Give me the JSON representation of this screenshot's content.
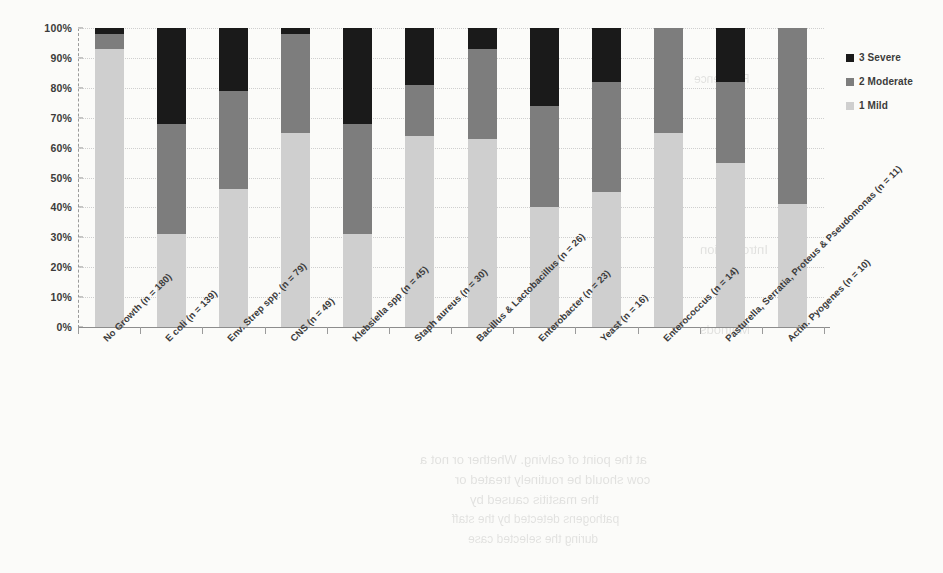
{
  "chart_data": {
    "type": "bar",
    "subtype": "100% stacked column",
    "title": "",
    "xlabel": "",
    "ylabel": "",
    "ylim": [
      0,
      100
    ],
    "ytick_labels": [
      "100%",
      "90%",
      "80%",
      "70%",
      "60%",
      "50%",
      "40%",
      "30%",
      "20%",
      "10%",
      "0%"
    ],
    "ytick_values": [
      100,
      90,
      80,
      70,
      60,
      50,
      40,
      30,
      20,
      10,
      0
    ],
    "grid": "horizontal dotted",
    "legend_position": "right",
    "categories": [
      "No Growth (n = 180)",
      "E coli (n = 139)",
      "Env. Strep spp. (n = 79)",
      "CNS (n = 49)",
      "Klebsiella spp (n = 45)",
      "Staph aureus (n = 30)",
      "Bacillus & Lactobacillus (n = 26)",
      "Enterobacter (n = 23)",
      "Yeast (n = 16)",
      "Enterococcus (n = 14)",
      "Pasturella, Serratia, Proteus & Pseudomonas (n = 11)",
      "Actin. Pyogenes (n = 10)"
    ],
    "series": [
      {
        "name": "1 Mild",
        "color": "#cfcfcf",
        "values": [
          93,
          31,
          46,
          65,
          31,
          64,
          63,
          40,
          45,
          65,
          55,
          41
        ]
      },
      {
        "name": "2 Moderate",
        "color": "#7d7d7d",
        "values": [
          5,
          37,
          33,
          33,
          37,
          17,
          30,
          34,
          37,
          35,
          27,
          59
        ]
      },
      {
        "name": "3 Severe",
        "color": "#1a1a1a",
        "values": [
          2,
          32,
          21,
          2,
          32,
          19,
          7,
          26,
          18,
          0,
          18,
          0
        ]
      }
    ]
  },
  "legend": {
    "items": [
      {
        "label": "3 Severe",
        "color": "#1a1a1a"
      },
      {
        "label": "2 Moderate",
        "color": "#7d7d7d"
      },
      {
        "label": "1 Mild",
        "color": "#cfcfcf"
      }
    ]
  },
  "background_bleed": {
    "lines": [
      {
        "text": "Reference",
        "x": 694,
        "y": 72,
        "size": 12
      },
      {
        "text": "Introduction",
        "x": 700,
        "y": 242,
        "size": 13
      },
      {
        "text": "Methods",
        "x": 700,
        "y": 322,
        "size": 13
      },
      {
        "text": "at the point of calving. Whether or not a",
        "x": 420,
        "y": 452,
        "size": 13
      },
      {
        "text": "cow should be routinely treated or",
        "x": 455,
        "y": 472,
        "size": 13
      },
      {
        "text": "the mastitis caused by",
        "x": 470,
        "y": 492,
        "size": 13
      },
      {
        "text": "pathogens detected by the staff",
        "x": 452,
        "y": 512,
        "size": 12
      },
      {
        "text": "during the selected case",
        "x": 468,
        "y": 532,
        "size": 12
      }
    ]
  }
}
